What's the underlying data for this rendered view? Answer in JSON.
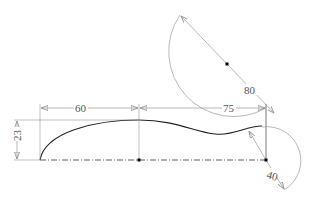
{
  "drawing": {
    "type": "cad-profile-sketch",
    "colors": {
      "profile": "#222222",
      "construction": "#999999",
      "dimension": "#888888",
      "text": "#555555",
      "point": "#000000"
    },
    "dimensions": {
      "horizontal_left": "60",
      "horizontal_right": "75",
      "vertical_height": "23",
      "large_arc_diameter": "80",
      "small_arc_radius": "40"
    },
    "points": [
      {
        "name": "start",
        "x": 40,
        "y": 160
      },
      {
        "name": "mid-base",
        "x": 139,
        "y": 160
      },
      {
        "name": "end-base",
        "x": 266,
        "y": 160
      },
      {
        "name": "large-arc-center",
        "x": 227,
        "y": 64
      }
    ]
  }
}
